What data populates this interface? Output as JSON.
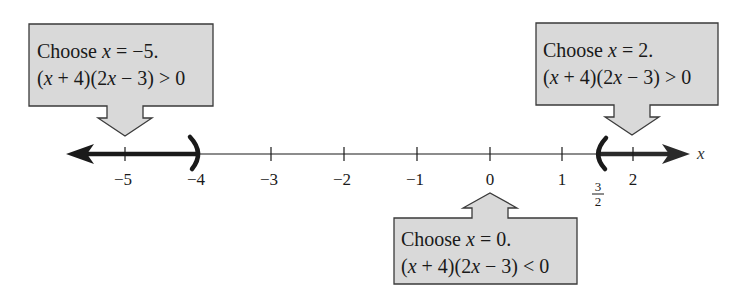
{
  "diagram": {
    "type": "number-line-test-intervals",
    "axis": {
      "variable": "x",
      "ticks": [
        {
          "value": -5,
          "label": "−5",
          "px": 125
        },
        {
          "value": -4,
          "label": "−4",
          "px": 198
        },
        {
          "value": -3,
          "label": "−3",
          "px": 271
        },
        {
          "value": -2,
          "label": "−2",
          "px": 344
        },
        {
          "value": -1,
          "label": "−1",
          "px": 417
        },
        {
          "value": 0,
          "label": "0",
          "px": 490
        },
        {
          "value": 1,
          "label": "1",
          "px": 562
        },
        {
          "value": 2,
          "label": "2",
          "px": 633
        }
      ],
      "fraction_tick": {
        "value": 1.5,
        "numerator": "3",
        "denominator": "2",
        "px": 598
      }
    },
    "shaded_intervals": [
      {
        "from": "-infinity",
        "to": -4,
        "endpoint": "open",
        "bracket": ")"
      },
      {
        "from": 1.5,
        "to": "infinity",
        "endpoint": "open",
        "bracket": "("
      }
    ],
    "callouts": [
      {
        "id": "left",
        "line1_prefix": "Choose ",
        "line1_var": "x",
        "line1_suffix": " = −5.",
        "line2": "(x + 4)(2x − 3) > 0",
        "points_to": -5
      },
      {
        "id": "middle",
        "line1_prefix": "Choose ",
        "line1_var": "x",
        "line1_suffix": " = 0.",
        "line2": "(x + 4)(2x − 3) < 0",
        "points_to": 0
      },
      {
        "id": "right",
        "line1_prefix": "Choose ",
        "line1_var": "x",
        "line1_suffix": " = 2.",
        "line2": "(x + 4)(2x − 3) > 0",
        "points_to": 2
      }
    ],
    "colors": {
      "box_fill": "#d9d9d9",
      "box_stroke": "#3a3a3a",
      "line": "#1a1a1a",
      "shaded": "#1a1a1a"
    }
  }
}
